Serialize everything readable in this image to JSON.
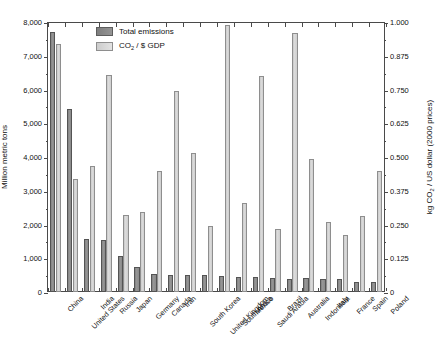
{
  "chart_data": {
    "type": "bar",
    "title": "",
    "subtitle": "",
    "xlabel": "",
    "ylabel": "Million metric tons",
    "y2label": "kg CO2 / US dollar (2000 prices)",
    "y2label_parts": {
      "prefix": "kg CO",
      "sub": "2",
      "suffix": " / US dollar (2000 prices)"
    },
    "grid": false,
    "legend_position": "top-center",
    "ylim": [
      0,
      8000
    ],
    "y2lim": [
      0,
      1.0
    ],
    "yticks": [
      0,
      1000,
      2000,
      3000,
      4000,
      5000,
      6000,
      7000,
      8000
    ],
    "ytick_labels": [
      "0",
      "1,000",
      "2,000",
      "3,000",
      "4,000",
      "5,000",
      "6,000",
      "7,000",
      "8,000"
    ],
    "y2ticks": [
      0,
      0.125,
      0.25,
      0.375,
      0.5,
      0.625,
      0.75,
      0.875,
      1.0
    ],
    "y2tick_labels": [
      "0",
      "0.125",
      "0.250",
      "0.375",
      "0.500",
      "0.625",
      "0.750",
      "0.875",
      "1.000"
    ],
    "categories": [
      "China",
      "United States",
      "India",
      "Russia",
      "Japan",
      "Germany",
      "Canada",
      "Iran",
      "South Korea",
      "United Kingdom",
      "South Africa",
      "Mexico",
      "Saudi Arabia",
      "Brazil",
      "Australia",
      "Indonesia",
      "Italy",
      "France",
      "Spain",
      "Poland"
    ],
    "series": [
      {
        "name": "Total emissions",
        "axis": "left",
        "color": "#8a8a8a",
        "units": "Million metric tons",
        "values": [
          7710,
          5420,
          1580,
          1540,
          1080,
          755,
          520,
          505,
          505,
          490,
          465,
          450,
          455,
          430,
          400,
          420,
          395,
          400,
          300,
          290
        ]
      },
      {
        "name": "CO2 / $ GDP",
        "axis": "right",
        "color": "#d2d2d2",
        "units": "kg CO2 / US dollar (2000 prices)",
        "legend_parts": {
          "prefix": "CO",
          "sub": "2",
          "suffix": " / $ GDP"
        },
        "values": [
          0.92,
          0.418,
          0.468,
          0.805,
          0.287,
          0.295,
          0.447,
          0.745,
          0.516,
          0.243,
          0.988,
          0.33,
          0.8,
          0.232,
          0.96,
          0.493,
          0.258,
          0.213,
          0.28,
          0.447
        ]
      }
    ]
  }
}
